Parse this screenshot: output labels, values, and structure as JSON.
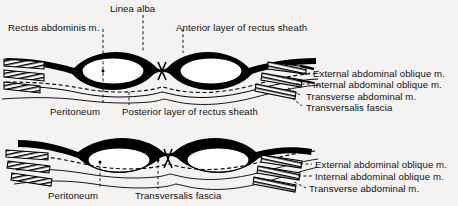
{
  "figure": {
    "background_color": "#f4f3f1",
    "ink_color": "#000000",
    "panels": [
      {
        "name": "upper-panel",
        "description": "Section above the arcuate line: rectus abdominis enclosed by anterior and posterior layers of rectus sheath",
        "labels_top": [
          {
            "key": "rectus_abdominis",
            "text": "Rectus abdominis m."
          },
          {
            "key": "linea_alba",
            "text": "Linea alba"
          },
          {
            "key": "anterior_layer",
            "text": "Anterior layer of rectus sheath"
          }
        ],
        "labels_bottom": [
          {
            "key": "peritoneum",
            "text": "Peritoneum"
          },
          {
            "key": "posterior_layer",
            "text": "Posterior layer of rectus sheath"
          }
        ],
        "labels_right": [
          {
            "key": "external_oblique",
            "text": "External abdominal oblique m."
          },
          {
            "key": "internal_oblique",
            "text": "Internal abdominal oblique m."
          },
          {
            "key": "transverse_abdominal",
            "text": "Transverse abdominal m."
          },
          {
            "key": "transversalis_fascia",
            "text": "Transversalis fascia"
          }
        ]
      },
      {
        "name": "lower-panel",
        "description": "Section below the arcuate line: all aponeuroses pass anterior to rectus abdominis",
        "labels_bottom": [
          {
            "key": "peritoneum",
            "text": "Peritoneum"
          },
          {
            "key": "transversalis_fascia",
            "text": "Transversalis fascia"
          }
        ],
        "labels_right": [
          {
            "key": "external_oblique",
            "text": "External abdominal oblique m."
          },
          {
            "key": "internal_oblique",
            "text": "Internal abdominal oblique m."
          },
          {
            "key": "transverse_abdominal",
            "text": "Transverse abdominal m."
          }
        ]
      }
    ]
  }
}
